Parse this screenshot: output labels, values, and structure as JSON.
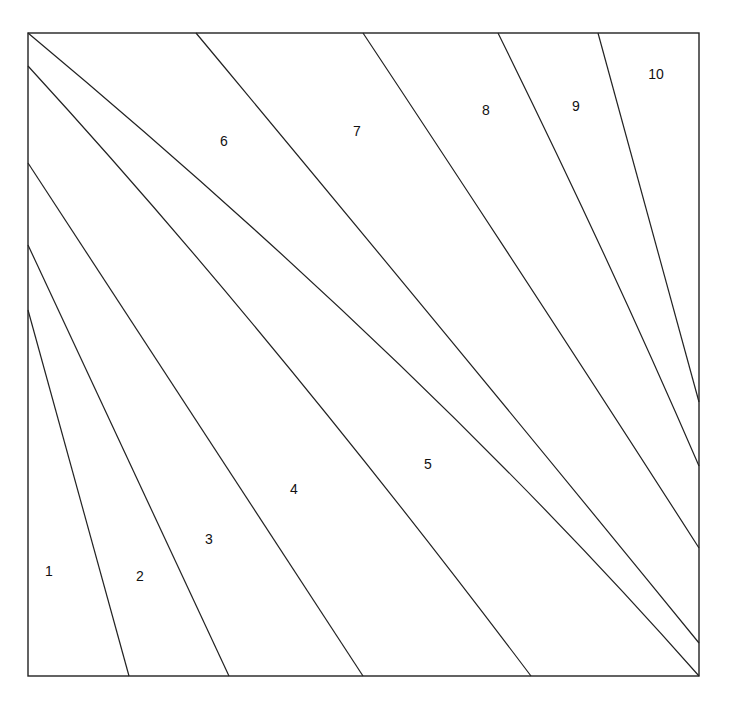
{
  "diagram": {
    "type": "partitioned-square",
    "stroke_color": "#222222",
    "background": "#ffffff",
    "frame": {
      "x": 28,
      "y": 33,
      "width": 671,
      "height": 643
    },
    "dividers": [
      {
        "id": "d1",
        "path": "M28,310 L129,676"
      },
      {
        "id": "d2",
        "path": "M28,245 L229,676"
      },
      {
        "id": "d3",
        "path": "M28,163 L363,676"
      },
      {
        "id": "d4",
        "path": "M28,66 Q270,330 531,676"
      },
      {
        "id": "d5",
        "path": "M28,33 Q420,360 699,676"
      },
      {
        "id": "d6",
        "path": "M196,33 Q460,350 699,643"
      },
      {
        "id": "d7",
        "path": "M363,33 Q540,300 699,548"
      },
      {
        "id": "d8",
        "path": "M498,33 Q610,260 699,466"
      },
      {
        "id": "d9",
        "path": "M598,33 L699,402"
      }
    ],
    "regions": [
      {
        "label": "1",
        "x": 49,
        "y": 572
      },
      {
        "label": "2",
        "x": 140,
        "y": 577
      },
      {
        "label": "3",
        "x": 209,
        "y": 540
      },
      {
        "label": "4",
        "x": 294,
        "y": 490
      },
      {
        "label": "5",
        "x": 428,
        "y": 465
      },
      {
        "label": "6",
        "x": 224,
        "y": 142
      },
      {
        "label": "7",
        "x": 357,
        "y": 132
      },
      {
        "label": "8",
        "x": 486,
        "y": 111
      },
      {
        "label": "9",
        "x": 576,
        "y": 107
      },
      {
        "label": "10",
        "x": 656,
        "y": 75
      }
    ]
  }
}
